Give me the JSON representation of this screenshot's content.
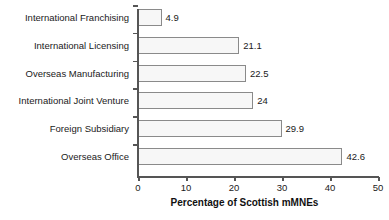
{
  "chart_data": {
    "type": "bar",
    "orientation": "horizontal",
    "title": "",
    "xlabel": "Percentage of Scottish mMNEs",
    "ylabel": "",
    "categories": [
      "International Franchising",
      "International Licensing",
      "Overseas Manufacturing",
      "International Joint Venture",
      "Foreign Subsidiary",
      "Overseas Office"
    ],
    "values": [
      4.9,
      21.1,
      22.5,
      24,
      29.9,
      42.6
    ],
    "value_labels": [
      "4.9",
      "21.1",
      "22.5",
      "24",
      "29.9",
      "42.6"
    ],
    "xlim": [
      0,
      50
    ],
    "xticks": [
      0,
      10,
      20,
      30,
      40,
      50
    ],
    "xtick_labels": [
      "0",
      "10",
      "20",
      "30",
      "40",
      "50"
    ],
    "grid": false,
    "legend": null,
    "bar_fill_color": "#f7f7f7",
    "bar_edge_color": "#8a8a8a",
    "axis_color": "#555555",
    "text_color": "#1a1a1a"
  }
}
